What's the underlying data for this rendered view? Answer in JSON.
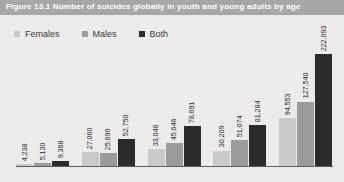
{
  "figure": {
    "title": "Figure 13.1  Number of suicides globally in youth and young adults by age"
  },
  "legend": {
    "items": [
      {
        "label": "Females",
        "color": "#c9c9c7",
        "swatch_name": "legend-swatch-females"
      },
      {
        "label": "Males",
        "color": "#9b9b99",
        "swatch_name": "legend-swatch-males"
      },
      {
        "label": "Both",
        "color": "#2b2b2b",
        "swatch_name": "legend-swatch-both"
      }
    ]
  },
  "chart_data": {
    "type": "bar",
    "title": "Figure 13.1  Number of suicides globally in youth and young adults by age",
    "xlabel": "",
    "ylabel": "",
    "grid": false,
    "legend_position": "top-left",
    "categories": [
      "5-9",
      "10-14",
      "15-19",
      "20-24",
      "Total"
    ],
    "categories_visible": false,
    "ylim": [
      0,
      240000
    ],
    "series": [
      {
        "name": "Females",
        "color": "#c9c9c7",
        "values": [
          4238,
          27060,
          33046,
          30209,
          94553
        ],
        "labels": [
          "4,238",
          "27,060",
          "33,046",
          "30,209",
          "94,553"
        ]
      },
      {
        "name": "Males",
        "color": "#9b9b99",
        "values": [
          5130,
          25690,
          45646,
          51074,
          127540
        ],
        "labels": [
          "5,130",
          "25,690",
          "45,646",
          "51,074",
          "127,540"
        ]
      },
      {
        "name": "Both",
        "color": "#2b2b2b",
        "values": [
          9368,
          52750,
          78691,
          81284,
          222093
        ],
        "labels": [
          "9,368",
          "52,750",
          "78,691",
          "81,284",
          "222,093"
        ]
      }
    ]
  }
}
